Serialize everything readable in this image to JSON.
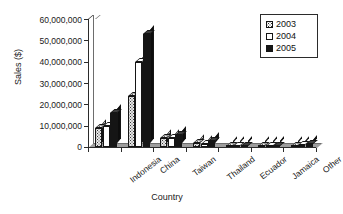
{
  "chart_data": {
    "type": "bar",
    "title": "",
    "xlabel": "Country",
    "ylabel": "Sales ($)",
    "categories": [
      "Indonesia",
      "China",
      "Taiwan",
      "Thailand",
      "Ecuador",
      "Jamaica",
      "Other"
    ],
    "series": [
      {
        "name": "2003",
        "values": [
          9000000,
          24000000,
          4000000,
          2000000,
          500000,
          300000,
          600000
        ]
      },
      {
        "name": "2004",
        "values": [
          10000000,
          40000000,
          4000000,
          1500000,
          600000,
          400000,
          800000
        ]
      },
      {
        "name": "2005",
        "values": [
          16000000,
          53000000,
          5500000,
          3000000,
          700000,
          500000,
          1500000
        ]
      }
    ],
    "ylim": [
      0,
      60000000
    ],
    "ytick_labels": [
      "60,000,000",
      "50,000,000",
      "40,000,000",
      "30,000,000",
      "20,000,000",
      "10,000,000",
      "0"
    ],
    "ytick_values": [
      60000000,
      50000000,
      40000000,
      30000000,
      20000000,
      10000000,
      0
    ],
    "grid": false,
    "legend_position": "top-right",
    "legend_entries": [
      "2003",
      "2004",
      "2005"
    ],
    "style": "3d-column"
  },
  "colors": {
    "axis": "#2b2b2b",
    "text": "#1a1a1a",
    "series_2003": "#e8e8e8",
    "series_2004": "#ffffff",
    "series_2005": "#151515",
    "background": "#ffffff"
  }
}
